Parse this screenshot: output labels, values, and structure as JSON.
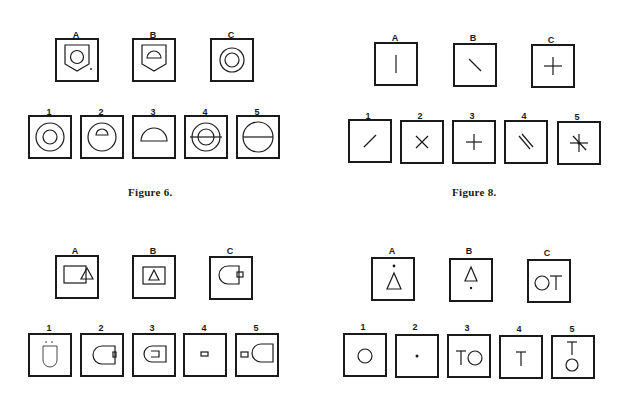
{
  "figures": {
    "fig6": {
      "caption": "Figure 6.",
      "stimulus_labels": [
        "A",
        "B",
        "C"
      ],
      "option_labels": [
        "1",
        "2",
        "3",
        "4",
        "5"
      ],
      "stimuli": [
        "pentagon-shield-with-circle-and-dot",
        "pentagon-shield-with-semicircle",
        "concentric-circles"
      ],
      "options": [
        "concentric-circles",
        "circle-with-semicircle",
        "semicircle",
        "concentric-circles-with-horizontal-line",
        "circle-with-horizontal-line"
      ]
    },
    "fig8": {
      "caption": "Figure 8.",
      "stimulus_labels": [
        "A",
        "B",
        "C"
      ],
      "option_labels": [
        "1",
        "2",
        "3",
        "4",
        "5"
      ],
      "stimuli": [
        "vertical-line",
        "diagonal-line-backslash",
        "plus-cross"
      ],
      "options": [
        "diagonal-line-slash",
        "x-cross",
        "plus-cross",
        "double-diagonal-lines",
        "star-cross"
      ]
    },
    "fig_bl": {
      "stimulus_labels": [
        "A",
        "B",
        "C"
      ],
      "option_labels": [
        "1",
        "2",
        "3",
        "4",
        "5"
      ],
      "stimuli": [
        "rectangle-with-overlapping-triangle",
        "rectangle-with-inner-triangle",
        "rounded-shape-with-small-square"
      ],
      "options": [
        "vertical-rounded-shape-with-marks",
        "rounded-shape-with-small-rectangle",
        "rounded-shape-with-inner-bracket",
        "small-rectangle",
        "small-rectangle-and-rounded-shape"
      ]
    },
    "fig_br": {
      "stimulus_labels": [
        "A",
        "B",
        "C"
      ],
      "option_labels": [
        "1",
        "2",
        "3",
        "4",
        "5"
      ],
      "stimuli": [
        "dot-above-triangle",
        "triangle-above-dot",
        "circle-and-T"
      ],
      "options": [
        "circle",
        "dot",
        "T-and-circle",
        "T",
        "T-above-circle"
      ],
      "glyphs": {
        "T": "T"
      }
    }
  }
}
